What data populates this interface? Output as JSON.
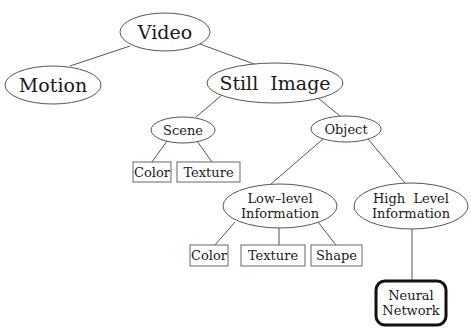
{
  "diagram": {
    "type": "tree",
    "nodes": {
      "video": {
        "lines": [
          "Video"
        ],
        "shape": "ellipse"
      },
      "motion": {
        "lines": [
          "Motion"
        ],
        "shape": "ellipse"
      },
      "still_image": {
        "lines": [
          "Still  Image"
        ],
        "shape": "ellipse"
      },
      "scene": {
        "lines": [
          "Scene"
        ],
        "shape": "ellipse"
      },
      "object": {
        "lines": [
          "Object"
        ],
        "shape": "ellipse"
      },
      "scene_color": {
        "lines": [
          "Color"
        ],
        "shape": "box"
      },
      "scene_texture": {
        "lines": [
          "Texture"
        ],
        "shape": "box"
      },
      "low_level": {
        "lines": [
          "Low–level",
          "Information"
        ],
        "shape": "ellipse"
      },
      "high_level": {
        "lines": [
          "High  Level",
          "Information"
        ],
        "shape": "ellipse"
      },
      "low_color": {
        "lines": [
          "Color"
        ],
        "shape": "box"
      },
      "low_texture": {
        "lines": [
          "Texture"
        ],
        "shape": "box"
      },
      "low_shape": {
        "lines": [
          "Shape"
        ],
        "shape": "box"
      },
      "neural_network": {
        "lines": [
          "Neural",
          "Network"
        ],
        "shape": "rounded-box-bold"
      }
    },
    "edges": [
      [
        "video",
        "motion"
      ],
      [
        "video",
        "still_image"
      ],
      [
        "still_image",
        "scene"
      ],
      [
        "still_image",
        "object"
      ],
      [
        "scene",
        "scene_color"
      ],
      [
        "scene",
        "scene_texture"
      ],
      [
        "object",
        "low_level"
      ],
      [
        "object",
        "high_level"
      ],
      [
        "low_level",
        "low_color"
      ],
      [
        "low_level",
        "low_texture"
      ],
      [
        "low_level",
        "low_shape"
      ],
      [
        "high_level",
        "neural_network"
      ]
    ]
  }
}
